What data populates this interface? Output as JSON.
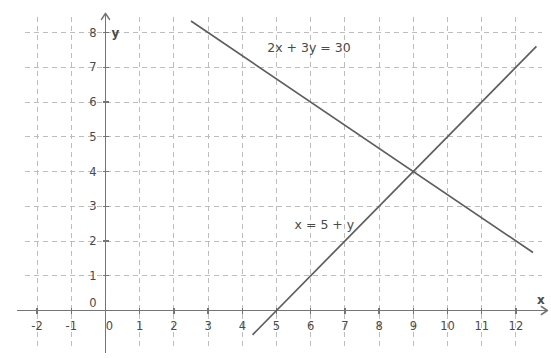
{
  "chart_data": {
    "type": "line",
    "title": "",
    "xlabel": "x",
    "ylabel": "y",
    "xlim": [
      -2.5,
      12.8
    ],
    "ylim": [
      -1.0,
      8.6
    ],
    "grid": true,
    "grid_style": "dashed",
    "legend": "inline-annotations",
    "x_ticks": [
      "-2",
      "-1",
      "0",
      "1",
      "2",
      "3",
      "4",
      "5",
      "6",
      "7",
      "8",
      "9",
      "10",
      "11",
      "12"
    ],
    "x_tick_values": [
      -2,
      -1,
      0,
      1,
      2,
      3,
      4,
      5,
      6,
      7,
      8,
      9,
      10,
      11,
      12
    ],
    "y_ticks": [
      "0",
      "1",
      "2",
      "3",
      "4",
      "5",
      "6",
      "7",
      "8"
    ],
    "y_tick_values": [
      0,
      1,
      2,
      3,
      4,
      5,
      6,
      7,
      8
    ],
    "series": [
      {
        "name": "2x + 3y = 30",
        "equation": "2x + 3y = 30",
        "slope": -0.6667,
        "intercept": 10,
        "x": [
          2.5,
          12.5
        ],
        "values": [
          8.33,
          1.67
        ],
        "label_x": 5.95,
        "label_y": 7.45
      },
      {
        "name": "x = 5 + y",
        "equation": "x = 5 + y",
        "slope": 1,
        "intercept": -5,
        "x": [
          4.3,
          12.6
        ],
        "values": [
          -0.7,
          7.6
        ],
        "label_x": 6.4,
        "label_y": 2.35
      }
    ],
    "intersection": {
      "x": 9,
      "y": 4
    },
    "annotations": [
      {
        "text": "2x + 3y = 30",
        "x": 5.95,
        "y": 7.45
      },
      {
        "text": "x = 5 + y",
        "x": 6.4,
        "y": 2.35
      }
    ],
    "colors": {
      "background": "#ffffff",
      "grid": "#bdbdbd",
      "axis": "#757575",
      "line": "#5e5e5e",
      "text": "#4a4a4a"
    }
  },
  "axes": {
    "x_axis_name": "x",
    "y_axis_name": "y"
  }
}
